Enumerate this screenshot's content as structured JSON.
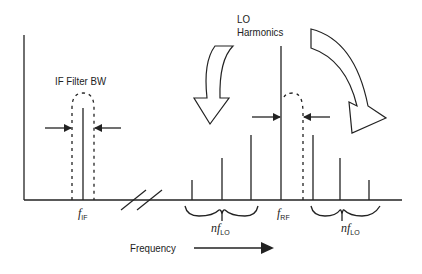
{
  "diagram": {
    "labels": {
      "if_filter_bw": "IF Filter BW",
      "lo_line1": "LO",
      "lo_line2": "Harmonics",
      "f_if_main": "f",
      "f_if_sub": "IF",
      "f_rf_main": "f",
      "f_rf_sub": "RF",
      "nflo_left_main": "nf",
      "nflo_left_sub": "LO",
      "nflo_right_main": "nf",
      "nflo_right_sub": "LO",
      "frequency": "Frequency"
    },
    "colors": {
      "stroke": "#222222",
      "background": "#ffffff"
    },
    "spectral_lines": [
      {
        "name": "f_if",
        "x": 83,
        "top": 108
      },
      {
        "name": "lo_harmonic_left_1",
        "x": 192,
        "top": 180
      },
      {
        "name": "lo_harmonic_left_2",
        "x": 222,
        "top": 158
      },
      {
        "name": "lo_harmonic_left_3",
        "x": 251,
        "top": 135
      },
      {
        "name": "f_rf",
        "x": 281,
        "top": 46
      },
      {
        "name": "lo_harmonic_right_1",
        "x": 313,
        "top": 135
      },
      {
        "name": "lo_harmonic_right_2",
        "x": 340,
        "top": 158
      },
      {
        "name": "lo_harmonic_right_3",
        "x": 369,
        "top": 180
      }
    ]
  }
}
